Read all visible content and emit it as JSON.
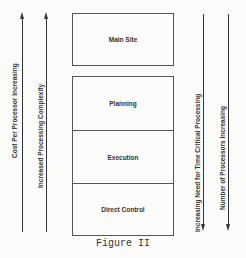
{
  "diagram": {
    "main_site_box": {
      "label": "Main Site"
    },
    "stack_boxes": [
      {
        "label": "Planning"
      },
      {
        "label": "Execution"
      },
      {
        "label": "Direct Control"
      }
    ],
    "left_arrows": [
      {
        "label": "Cost Per Processor Increasing",
        "direction": "up"
      },
      {
        "label": "Increased Processing Complexity",
        "direction": "up"
      }
    ],
    "right_arrows": [
      {
        "label": "Increasing Need for Time Critical Processing",
        "direction": "down"
      },
      {
        "label": "Number of Processors Increasing",
        "direction": "down"
      }
    ],
    "caption": "Figure II",
    "colors": {
      "line": "#333333",
      "background": "#fbfbf9"
    }
  }
}
